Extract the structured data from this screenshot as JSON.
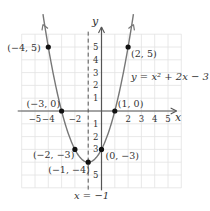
{
  "chart_data": {
    "type": "line",
    "title": "",
    "equation": "y = x² + 2x − 3",
    "xlabel": "x",
    "ylabel": "y",
    "xlim": [
      -6,
      6
    ],
    "ylim": [
      -6,
      6
    ],
    "grid": true,
    "x_ticks": [
      -5,
      -4,
      -2,
      2,
      3,
      4,
      5
    ],
    "x_tick_labels": [
      "−5",
      "−4",
      "−2",
      "2",
      "3",
      "4",
      "5"
    ],
    "y_ticks": [
      5,
      4,
      3,
      2,
      1,
      -1,
      -2,
      -3,
      -5
    ],
    "y_tick_labels": [
      "5",
      "4",
      "3",
      "2",
      "1",
      "1",
      "2",
      "3",
      "5"
    ],
    "axis_of_symmetry": {
      "x": -1,
      "label": "x = −1"
    },
    "points": [
      {
        "x": -4,
        "y": 5,
        "label": "(−4, 5)"
      },
      {
        "x": 2,
        "y": 5,
        "label": "(2, 5)"
      },
      {
        "x": -3,
        "y": 0,
        "label": "(−3, 0)"
      },
      {
        "x": 1,
        "y": 0,
        "label": "(1, 0)"
      },
      {
        "x": -2,
        "y": -3,
        "label": "(−2, −3)"
      },
      {
        "x": 0,
        "y": -3,
        "label": "(0, −3)"
      },
      {
        "x": -1,
        "y": -4,
        "label": "(−1, −4)"
      }
    ],
    "series": [
      {
        "name": "y = x² + 2x − 3",
        "x": [
          -4.4,
          -4,
          -3,
          -2,
          -1,
          0,
          1,
          2,
          2.4
        ],
        "values": [
          6.76,
          5,
          0,
          -3,
          -4,
          -3,
          0,
          5,
          6.76
        ]
      }
    ]
  },
  "colors": {
    "curve": "#777777",
    "axis": "#555555",
    "grid": "#e2e2e2",
    "point": "#111111",
    "text": "#333333"
  }
}
